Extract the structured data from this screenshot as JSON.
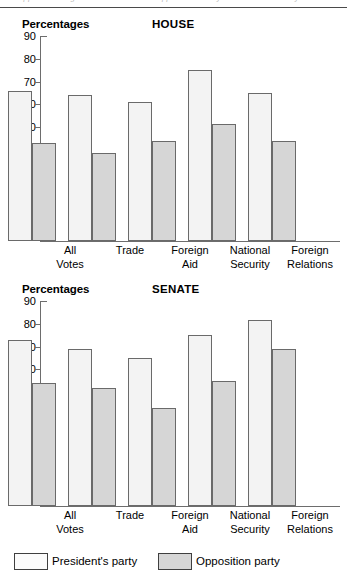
{
  "page": {
    "cut_header_text": "Appendix B  Figure B-3  Presidential Support Scores by Chamber and Policy Area"
  },
  "legend": {
    "items": [
      {
        "label": "President's party",
        "swatch": "pres",
        "color": "#fbfbfb"
      },
      {
        "label": "Opposition party",
        "swatch": "opp",
        "color": "#d6d6d6"
      }
    ]
  },
  "chart_data": [
    {
      "type": "bar",
      "title": "HOUSE",
      "ylabel": "Percentages",
      "xlabel": "",
      "ylim": [
        0,
        90
      ],
      "yticks": [
        90,
        80,
        70,
        60,
        50,
        40,
        30,
        20,
        10
      ],
      "grid": false,
      "legend_position": "bottom",
      "categories": [
        "All\nVotes",
        "Trade",
        "Foreign\nAid",
        "National\nSecurity",
        "Foreign\nRelations"
      ],
      "series": [
        {
          "name": "President's party",
          "values": [
            66,
            64,
            61,
            75,
            65
          ]
        },
        {
          "name": "Opposition party",
          "values": [
            43,
            38.5,
            44,
            51.5,
            44
          ]
        }
      ]
    },
    {
      "type": "bar",
      "title": "SENATE",
      "ylabel": "Percentages",
      "xlabel": "",
      "ylim": [
        0,
        90
      ],
      "yticks": [
        90,
        80,
        70,
        60,
        50,
        40,
        30,
        20,
        10
      ],
      "grid": false,
      "legend_position": "bottom",
      "categories": [
        "All\nVotes",
        "Trade",
        "Foreign\nAid",
        "National\nSecurity",
        "Foreign\nRelations"
      ],
      "series": [
        {
          "name": "President's party",
          "values": [
            73,
            69,
            65,
            75,
            81.5
          ]
        },
        {
          "name": "Opposition party",
          "values": [
            54,
            52,
            43,
            55,
            69
          ]
        }
      ]
    }
  ]
}
